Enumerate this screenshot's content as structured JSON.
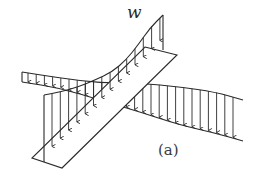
{
  "figure": {
    "load_label": "w",
    "panel_label": "(a)",
    "stroke_color": "#2a2a2a",
    "background": "#ffffff"
  },
  "geometry": {
    "diagonal_strip": {
      "corners": [
        [
          145,
          47
        ],
        [
          177,
          55
        ],
        [
          62,
          168
        ],
        [
          32,
          158
        ]
      ]
    },
    "diagonal_load_top": [
      [
        163,
        15
      ],
      [
        150,
        28
      ],
      [
        138,
        45
      ],
      [
        126,
        60
      ],
      [
        112,
        72
      ],
      [
        95,
        80
      ],
      [
        78,
        87
      ],
      [
        60,
        92
      ],
      [
        44,
        95
      ]
    ],
    "diagonal_load_left_edge": [
      [
        44,
        95
      ],
      [
        44,
        162
      ]
    ],
    "diagonal_load_peak_edge": [
      [
        163,
        15
      ],
      [
        163,
        50
      ]
    ],
    "horizontal_strip_top": [
      [
        22,
        72
      ],
      [
        60,
        78
      ],
      [
        100,
        83
      ],
      [
        140,
        83
      ],
      [
        180,
        87
      ],
      [
        215,
        92
      ],
      [
        243,
        100
      ]
    ],
    "horizontal_strip_bottom": [
      [
        22,
        82
      ],
      [
        60,
        88
      ],
      [
        100,
        100
      ],
      [
        140,
        112
      ],
      [
        180,
        125
      ],
      [
        215,
        133
      ],
      [
        243,
        141
      ]
    ]
  }
}
